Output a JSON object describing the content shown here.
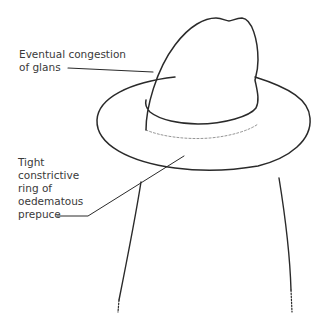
{
  "diagram": {
    "type": "medical-illustration",
    "colors": {
      "line": "#2a2a2a",
      "text": "#3a3a3a",
      "background": "#ffffff"
    },
    "labels": [
      {
        "id": "glans",
        "lines": [
          "Eventual congestion",
          "of glans"
        ]
      },
      {
        "id": "prepuce",
        "lines": [
          "Tight",
          "constrictive",
          "ring of",
          "oedematous",
          "prepuce"
        ]
      }
    ]
  }
}
